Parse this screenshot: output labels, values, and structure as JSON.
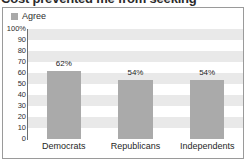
{
  "title": {
    "text": "Cost prevented me from seeking"
  },
  "legend": {
    "position": "top-left",
    "entries": [
      {
        "label": "Agree",
        "color": "#a9a9a9",
        "swatch_icon": "legend-swatch-icon"
      }
    ]
  },
  "axes": {
    "y_ticks": [
      "100%",
      "90",
      "80",
      "70",
      "60",
      "50",
      "40",
      "30",
      "20",
      "10",
      "0"
    ],
    "y_values": [
      100,
      90,
      80,
      70,
      60,
      50,
      40,
      30,
      20,
      10,
      0
    ]
  },
  "colors": {
    "bar": "#aaaaaa",
    "band": "#e9e9e9",
    "plot_background": "#ffffff",
    "frame_border": "#9a9a9a",
    "axis_line": "#6f6f6f",
    "text": "#242424"
  },
  "chart_data": {
    "type": "bar",
    "title": "Cost prevented me from seeking",
    "xlabel": "",
    "ylabel": "",
    "ylim": [
      0,
      100
    ],
    "grid": "horizontal-bands",
    "legend_position": "top-left",
    "categories": [
      "Democrats",
      "Republicans",
      "Independents"
    ],
    "series": [
      {
        "name": "Agree",
        "color": "#aaaaaa",
        "values": [
          62,
          54,
          54
        ],
        "labels": [
          "62%",
          "54%",
          "54%"
        ]
      }
    ]
  }
}
